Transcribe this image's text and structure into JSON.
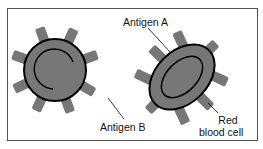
{
  "diagram": {
    "labels": {
      "antigen_a": "Antigen A",
      "antigen_b": "Antigen B",
      "red_blood_cell_line1": "Red",
      "red_blood_cell_line2": "blood cell"
    },
    "colors": {
      "cell_fill": "#777777",
      "antigen_fill": "#777777",
      "outline": "#000000",
      "frame": "#555555"
    }
  }
}
